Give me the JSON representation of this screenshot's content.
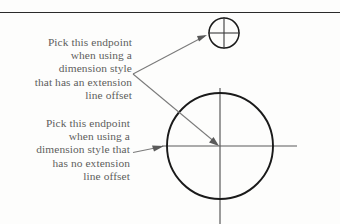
{
  "figure": {
    "background_color": "#fdfdfc",
    "ink_color": "#1a1a1a",
    "leader_color": "#6b6b6b",
    "text_color": "#5d5d5d"
  },
  "top_rule": {
    "name": "horizontal-rule",
    "x1": 0,
    "y1": 12,
    "x2": 340,
    "y2": 13
  },
  "annotations": {
    "top": {
      "lines": [
        "Pick this endpoint",
        "when using a",
        "dimension style",
        "that has an extension",
        "line offset"
      ]
    },
    "bottom": {
      "lines": [
        "Pick this endpoint",
        "when using a",
        "dimension style that",
        "has no extension",
        "line offset"
      ]
    }
  },
  "shapes": {
    "small_circle": {
      "label": "small-circle",
      "cx": 224,
      "cy": 33,
      "r": 15,
      "crosshair_h": {
        "x1": 207,
        "y1": 33,
        "x2": 241,
        "y2": 33
      },
      "crosshair_v": {
        "x1": 224,
        "y1": 17,
        "x2": 224,
        "y2": 49
      }
    },
    "large_circle": {
      "label": "large-circle",
      "cx": 220,
      "cy": 146,
      "r": 53,
      "crosshair_h": {
        "x1": 162,
        "y1": 146,
        "x2": 297,
        "y2": 146
      },
      "crosshair_v": {
        "x1": 220,
        "y1": 88,
        "x2": 220,
        "y2": 224
      }
    }
  },
  "leaders": {
    "vertex": {
      "x": 133,
      "y": 74
    },
    "upper": {
      "label": "leader-to-small-circle",
      "from": {
        "x": 133,
        "y": 74
      },
      "to": {
        "x": 207,
        "y": 35
      }
    },
    "lower": {
      "label": "leader-to-large-circle-center",
      "from": {
        "x": 133,
        "y": 74
      },
      "to": {
        "x": 218,
        "y": 145
      }
    },
    "bottom": {
      "label": "leader-to-large-circle-edge",
      "from": {
        "x": 133,
        "y": 152
      },
      "to": {
        "x": 164,
        "y": 146
      }
    }
  }
}
